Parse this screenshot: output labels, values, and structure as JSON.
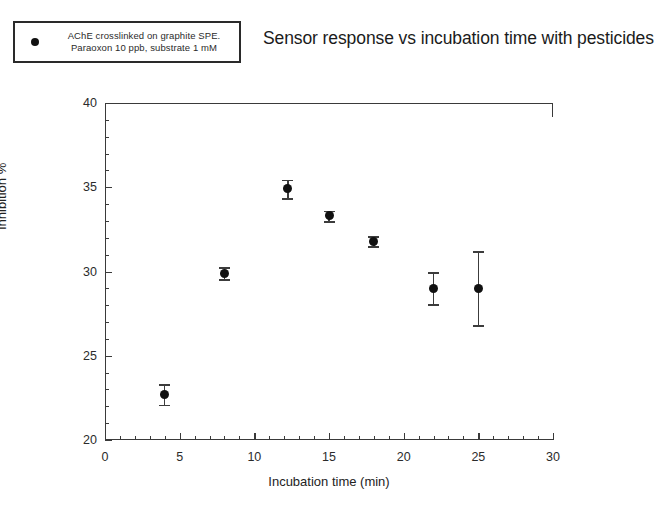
{
  "legend": {
    "marker_icon": "filled-circle-marker",
    "lines": [
      "AChE crosslinked on graphite SPE.",
      "Paraoxon 10 ppb, substrate 1 mM"
    ]
  },
  "chart_data": {
    "type": "scatter",
    "title": "Sensor response vs incubation time with pesticides",
    "xlabel": "Incubation time (min)",
    "ylabel": "Inhibition %",
    "xlim": [
      0,
      30
    ],
    "ylim": [
      20,
      40
    ],
    "x_major_ticks": [
      0,
      5,
      10,
      15,
      20,
      25,
      30
    ],
    "x_tick_labels": [
      "0",
      "5",
      "10",
      "15",
      "20",
      "25",
      "30"
    ],
    "x_minor_step": 1,
    "y_major_ticks": [
      20,
      25,
      30,
      35,
      40
    ],
    "y_tick_labels": [
      "20",
      "25",
      "30",
      "35",
      "40"
    ],
    "y_minor_step": 1,
    "grid": false,
    "legend_position": "outside-top-left",
    "series": [
      {
        "name": "AChE crosslinked on graphite SPE. Paraoxon 10 ppb, substrate 1 mM",
        "marker": "filled-circle",
        "color": "#111111",
        "x": [
          4,
          8,
          12.25,
          15,
          18,
          22,
          25
        ],
        "y": [
          22.7,
          29.9,
          34.9,
          33.3,
          31.8,
          29.0,
          29.0
        ],
        "yerr": [
          0.6,
          0.35,
          0.55,
          0.3,
          0.3,
          0.95,
          2.2
        ]
      }
    ]
  }
}
